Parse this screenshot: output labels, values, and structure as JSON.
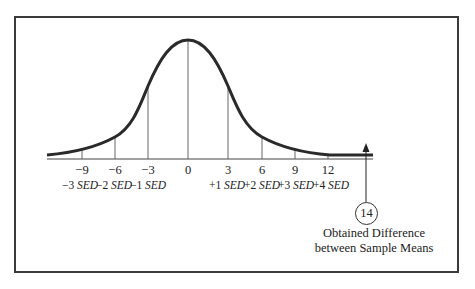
{
  "diagram": {
    "type": "sampling-distribution-of-differences",
    "baseline": {
      "x_start": 47,
      "x_end": 373,
      "y": 159
    },
    "tick_values": [
      {
        "value": "−9",
        "x": 82,
        "sed": "−3",
        "unit": "SED"
      },
      {
        "value": "−6",
        "x": 115,
        "sed": "−2",
        "unit": "SED"
      },
      {
        "value": "−3",
        "x": 148,
        "sed": "−1",
        "unit": "SED"
      },
      {
        "value": "0",
        "x": 188,
        "sed": "",
        "unit": ""
      },
      {
        "value": "3",
        "x": 228,
        "sed": "+1",
        "unit": "SED"
      },
      {
        "value": "6",
        "x": 262,
        "sed": "+2",
        "unit": "SED"
      },
      {
        "value": "9",
        "x": 295,
        "sed": "+3",
        "unit": "SED"
      },
      {
        "value": "12",
        "x": 328,
        "sed": "+4",
        "unit": "SED"
      }
    ],
    "obtained_value": "14",
    "caption_line1": "Obtained Difference",
    "caption_line2": "between Sample Means",
    "colors": {
      "line": "#2a2a2a",
      "frame": "#3a3a3a",
      "gridline": "#555555"
    }
  }
}
